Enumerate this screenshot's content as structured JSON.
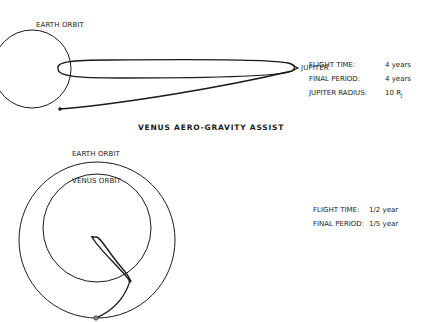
{
  "top_diagram": {
    "earth_orbit_label": "EARTH ORBIT",
    "destination_label": "JUPITER",
    "stats": [
      {
        "label": "FLIGHT TIME:",
        "value": "4 years"
      },
      {
        "label": "FINAL PERIOD:",
        "value": "4 years"
      },
      {
        "label": "JUPITER RADIUS:",
        "value": "10 R",
        "subscript": "J"
      }
    ]
  },
  "bottom_diagram": {
    "title": "VENUS AERO-GRAVITY ASSIST",
    "earth_orbit_label": "EARTH ORBIT",
    "venus_orbit_label": "VENUS ORBIT",
    "stats": [
      {
        "label": "FLIGHT TIME:",
        "value": "1/2 year"
      },
      {
        "label": "FINAL PERIOD:",
        "value": "1/5 year"
      }
    ]
  },
  "colors": {
    "ink": "#1a1a1a",
    "background": "#ffffff"
  }
}
